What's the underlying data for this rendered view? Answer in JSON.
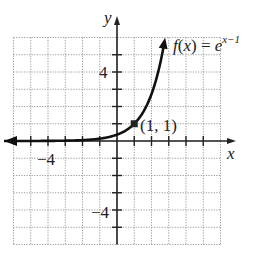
{
  "chart_data": {
    "type": "line",
    "title": "",
    "function_label": "f(x) = e^{x-1}",
    "function_label_parts": {
      "f": "f",
      "open": "(",
      "x": "x",
      "close": ")",
      "eq": "=",
      "base": "e",
      "exp": "x−1"
    },
    "xlabel": "x",
    "ylabel": "y",
    "xlim": [
      -6,
      6
    ],
    "ylim": [
      -6,
      6
    ],
    "grid": true,
    "grid_style": "dotted",
    "x_tick_labels": [
      {
        "value": -4,
        "label": "−4"
      }
    ],
    "y_tick_labels": [
      {
        "value": 4,
        "label": "4"
      },
      {
        "value": -4,
        "label": "−4"
      }
    ],
    "series": [
      {
        "name": "f(x) = e^(x-1)",
        "x": [
          -6.5,
          -5,
          -4,
          -3,
          -2,
          -1,
          0,
          0.5,
          1,
          1.5,
          2,
          2.5,
          2.79
        ],
        "y": [
          0.0015,
          0.0025,
          0.0067,
          0.018,
          0.05,
          0.135,
          0.368,
          0.607,
          1.0,
          1.649,
          2.718,
          4.482,
          5.99
        ]
      }
    ],
    "annotations": [
      {
        "point": [
          1,
          1
        ],
        "label": "(1, 1)",
        "marker": "filled-square"
      }
    ],
    "legend": "none"
  },
  "labels": {
    "x_axis": "x",
    "y_axis": "y",
    "x_tick_neg4": "−4",
    "y_tick_4": "4",
    "y_tick_neg4": "−4",
    "point_label": "(1, 1)",
    "fn_f": "f",
    "fn_paren_open": "(",
    "fn_x": "x",
    "fn_paren_close": ")",
    "fn_eq": " = ",
    "fn_e": "e",
    "fn_exp": "x−1"
  },
  "colors": {
    "axis": "#222222",
    "grid": "#9a9a9a",
    "curve": "#111111"
  }
}
